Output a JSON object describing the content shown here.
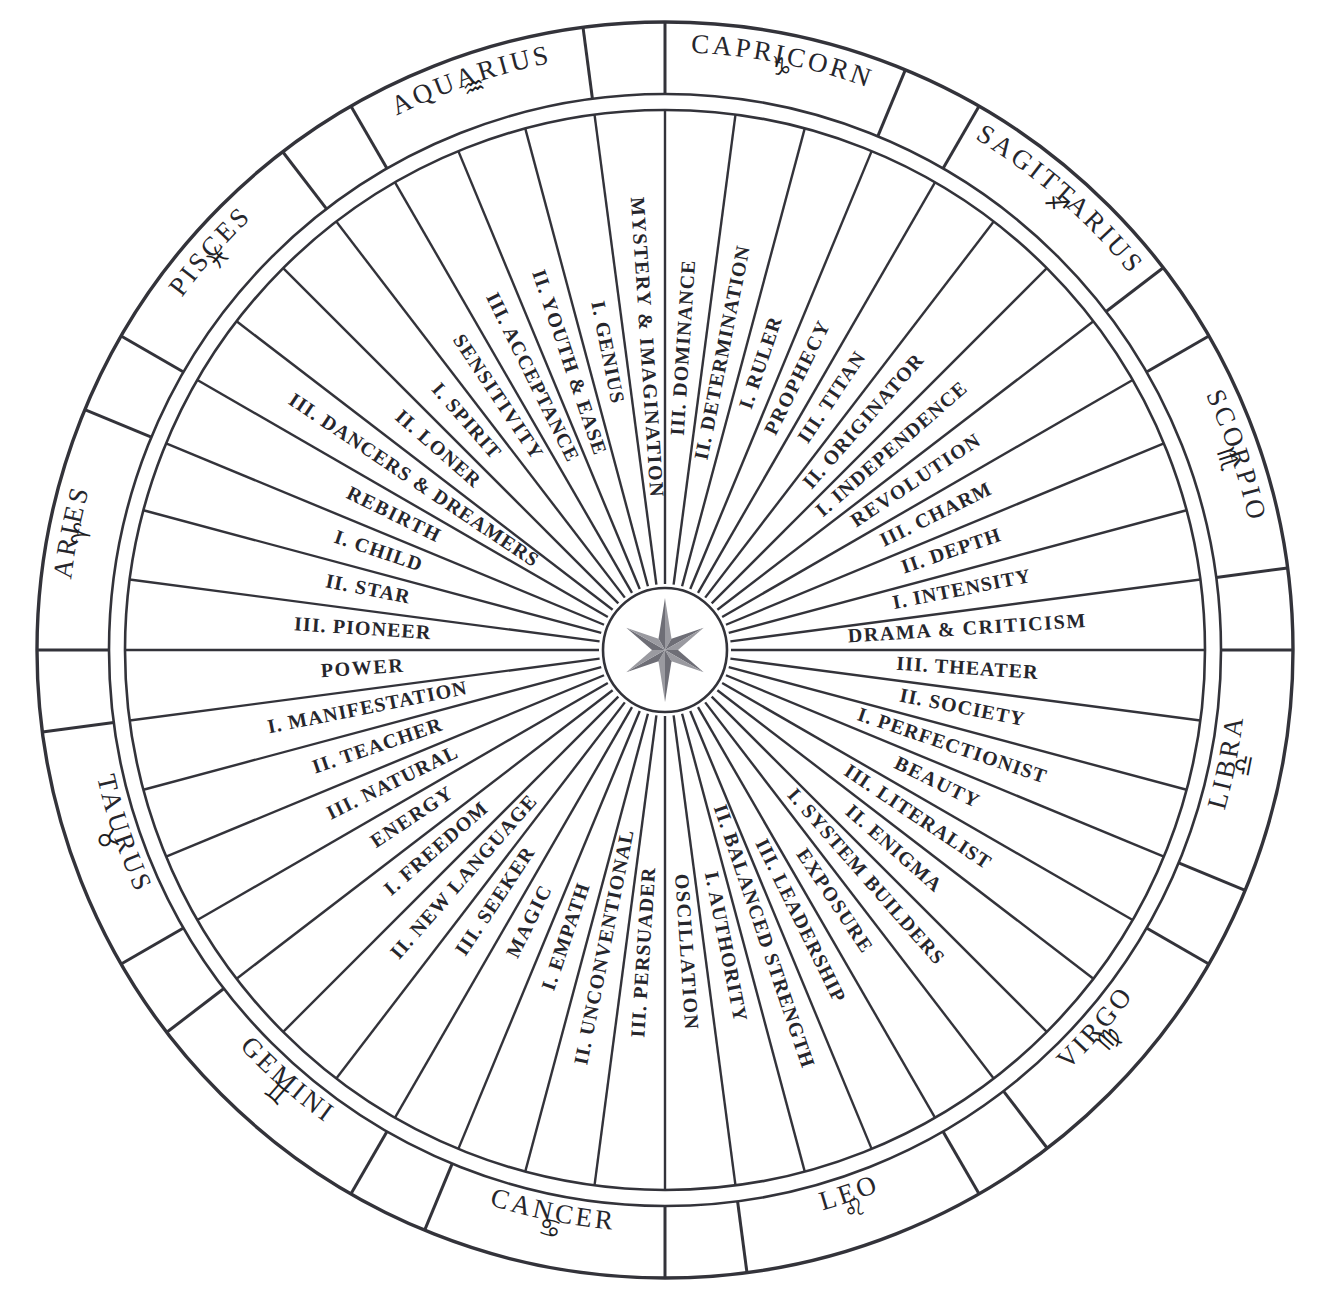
{
  "diagram": {
    "center_icon": "six-point-compass-star",
    "geometry": {
      "cx": 665,
      "cy": 650,
      "r_outer": 628,
      "r_sign_inner": 556,
      "r_decan_outer": 540,
      "r_hub": 62,
      "sector_count": 48,
      "start_angle_deg": -97.5
    }
  },
  "signs": [
    {
      "name": "CAPRICORN",
      "glyph": "♑",
      "cusp_before": "MYSTERY & IMAGINATION",
      "decans": [
        "III. DOMINANCE",
        "II. DETERMINATION",
        "I. RULER"
      ]
    },
    {
      "name": "SAGITTARIUS",
      "glyph": "♐",
      "cusp_before": "PROPHECY",
      "decans": [
        "III. TITAN",
        "II. ORIGINATOR",
        "I. INDEPENDENCE"
      ]
    },
    {
      "name": "SCORPIO",
      "glyph": "♏",
      "cusp_before": "REVOLUTION",
      "decans": [
        "III. CHARM",
        "II. DEPTH",
        "I. INTENSITY"
      ]
    },
    {
      "name": "LIBRA",
      "glyph": "♎",
      "cusp_before": "DRAMA & CRITICISM",
      "decans": [
        "III. THEATER",
        "II. SOCIETY",
        "I. PERFECTIONIST"
      ]
    },
    {
      "name": "VIRGO",
      "glyph": "♍",
      "cusp_before": "BEAUTY",
      "decans": [
        "III. LITERALIST",
        "II. ENIGMA",
        "I. SYSTEM BUILDERS"
      ]
    },
    {
      "name": "LEO",
      "glyph": "♌",
      "cusp_before": "EXPOSURE",
      "decans": [
        "III. LEADERSHIP",
        "II. BALANCED STRENGTH",
        "I. AUTHORITY"
      ]
    },
    {
      "name": "CANCER",
      "glyph": "♋",
      "cusp_before": "OSCILLATION",
      "decans": [
        "III. PERSUADER",
        "II. UNCONVENTIONAL",
        "I. EMPATH"
      ]
    },
    {
      "name": "GEMINI",
      "glyph": "♊",
      "cusp_before": "MAGIC",
      "decans": [
        "III. SEEKER",
        "II. NEW LANGUAGE",
        "I. FREEDOM"
      ]
    },
    {
      "name": "TAURUS",
      "glyph": "♉",
      "cusp_before": "ENERGY",
      "decans": [
        "III. NATURAL",
        "II. TEACHER",
        "I. MANIFESTATION"
      ]
    },
    {
      "name": "ARIES",
      "glyph": "♈",
      "cusp_before": "POWER",
      "decans": [
        "III. PIONEER",
        "II. STAR",
        "I. CHILD"
      ]
    },
    {
      "name": "PISCES",
      "glyph": "♓",
      "cusp_before": "REBIRTH",
      "decans": [
        "III. DANCERS & DREAMERS",
        "II. LONER",
        "I. SPIRIT"
      ]
    },
    {
      "name": "AQUARIUS",
      "glyph": "♒",
      "cusp_before": "SENSITIVITY",
      "decans": [
        "III. ACCEPTANCE",
        "II. YOUTH & EASE",
        "I. GENIUS"
      ]
    }
  ],
  "colors": {
    "ink": "#26262c",
    "line": "#33333a",
    "background": "#ffffff",
    "star_light": "#9a9aa0",
    "star_dark": "#6e6e76"
  }
}
